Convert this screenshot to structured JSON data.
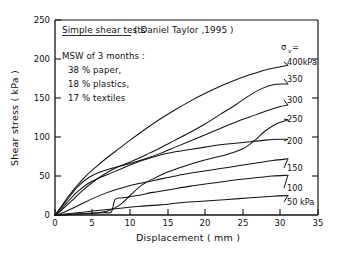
{
  "chart_data": {
    "type": "line",
    "title": "Simple shear tests ( Daniel Taylor ,1995 )",
    "xlabel": "Displacement ( mm )",
    "ylabel": "Shear stress ( kPa )",
    "xlim": [
      0,
      35
    ],
    "ylim": [
      0,
      250
    ],
    "xticks": [
      0,
      5,
      10,
      15,
      20,
      25,
      30,
      35
    ],
    "yticks": [
      0,
      50,
      100,
      150,
      200,
      250
    ],
    "grid": false,
    "legend_position": "right-of-curves (inline end labels)",
    "legend_header": "σv =",
    "annotations": [
      "Simple shear tests ( Daniel Taylor ,1995 )",
      "MSW of 3 months :",
      "38 % paper,",
      "18 % plastics,",
      "17 % textiles"
    ],
    "series": [
      {
        "name": "400 kPa",
        "label": "400kPa",
        "x": [
          0,
          0.4,
          1.0,
          1.8,
          2.8,
          4.0,
          5.5,
          7.0,
          8.5,
          10.0,
          12.0,
          14.0,
          16.0,
          18.0,
          20.0,
          22.0,
          24.0,
          26.0,
          28.0,
          29.5,
          31.0
        ],
        "y": [
          0,
          5,
          13,
          24,
          36,
          49,
          62,
          74,
          85,
          96,
          110,
          123,
          135,
          146,
          156,
          165,
          173,
          180,
          186,
          189,
          192
        ]
      },
      {
        "name": "350 kPa",
        "label": "350",
        "x": [
          0,
          0.5,
          1.2,
          2.2,
          3.5,
          5.0,
          6.5,
          8.0,
          9.5,
          11.0,
          12.5,
          14.0,
          16.0,
          18.0,
          20.0,
          22.0,
          24.0,
          26.0,
          27.5,
          29.0,
          30.5,
          31.0
        ],
        "y": [
          0,
          3,
          9,
          18,
          30,
          42,
          52,
          60,
          66,
          72,
          79,
          86,
          96,
          106,
          117,
          129,
          141,
          154,
          162,
          167,
          168,
          168
        ]
      },
      {
        "name": "300 kPa",
        "label": "300",
        "x": [
          0,
          0.5,
          1.5,
          3.0,
          4.5,
          6.0,
          8.0,
          10.0,
          12.0,
          14.0,
          16.0,
          18.0,
          20.0,
          22.0,
          24.0,
          26.0,
          28.0,
          30.0,
          31.0
        ],
        "y": [
          0,
          6,
          18,
          36,
          48,
          55,
          61,
          66,
          72,
          79,
          87,
          95,
          103,
          111,
          119,
          126,
          133,
          139,
          141
        ]
      },
      {
        "name": "250 kPa",
        "label": "250",
        "x": [
          0,
          1.0,
          2.5,
          4.0,
          5.5,
          7.0,
          8.5,
          10.0,
          11.5,
          13.0,
          15.0,
          17.0,
          19.0,
          21.0,
          23.0,
          25.0,
          26.5,
          28.0,
          29.5,
          31.0
        ],
        "y": [
          0,
          0,
          1,
          2,
          3,
          5,
          12,
          25,
          38,
          46,
          55,
          62,
          68,
          73,
          78,
          85,
          95,
          108,
          117,
          122
        ]
      },
      {
        "name": "200 kPa",
        "label": "200",
        "x": [
          0,
          0.6,
          1.6,
          3.0,
          4.5,
          6.0,
          7.5,
          9.0,
          10.5,
          12.0,
          14.0,
          16.0,
          18.0,
          20.0,
          22.0,
          24.0,
          26.0,
          28.0,
          30.0,
          31.0
        ],
        "y": [
          0,
          5,
          16,
          30,
          41,
          48,
          54,
          60,
          66,
          71,
          77,
          81,
          84,
          87,
          90,
          92,
          94,
          96,
          97,
          97
        ]
      },
      {
        "name": "150 kPa",
        "label": "150",
        "x": [
          0,
          0.8,
          2.0,
          3.5,
          5.0,
          7.0,
          9.0,
          11.0,
          13.0,
          15.0,
          17.0,
          19.0,
          21.0,
          23.0,
          25.0,
          27.0,
          29.0,
          31.0
        ],
        "y": [
          0,
          2,
          7,
          14,
          21,
          29,
          35,
          40,
          44,
          48,
          52,
          55,
          58,
          61,
          64,
          67,
          70,
          72
        ]
      },
      {
        "name": "100 kPa",
        "label": "100",
        "x": [
          0,
          1.0,
          2.5,
          4.5,
          6.5,
          7.5,
          8.0,
          9.0,
          11.0,
          13.0,
          15.0,
          18.0,
          21.0,
          24.0,
          27.0,
          29.0,
          31.0
        ],
        "y": [
          0,
          0,
          1,
          2,
          3,
          4,
          20,
          22,
          25,
          29,
          32,
          37,
          41,
          45,
          48,
          50,
          51
        ]
      },
      {
        "name": "50 kPa",
        "label": "50 kPa",
        "x": [
          0,
          2,
          5,
          8,
          11,
          14,
          17,
          20,
          23,
          26,
          29,
          31
        ],
        "y": [
          0,
          2,
          5,
          8,
          11,
          13,
          16,
          18,
          20,
          22,
          24,
          25
        ]
      }
    ]
  },
  "axes": {
    "y_title": "Shear stress ( kPa )",
    "x_title": "Displacement ( mm )",
    "x_tick_labels": [
      "0",
      "5",
      "10",
      "15",
      "20",
      "25",
      "30",
      "35"
    ],
    "y_tick_labels": [
      "0",
      "50",
      "100",
      "150",
      "200",
      "250"
    ]
  },
  "annotation_block": {
    "title": "Simple shear tests",
    "citation": "( Daniel Taylor ,1995 )",
    "line1": "MSW of 3 months :",
    "line2": "38 % paper,",
    "line3": "18 % plastics,",
    "line4": "17 % textiles"
  },
  "legend": {
    "header_sigma": "σ",
    "header_sub": "v",
    "header_eq": "=",
    "labels": [
      "400kPa",
      "350",
      "300",
      "250",
      "200",
      "150",
      "100",
      "50 kPa"
    ]
  },
  "colors": {
    "ink": "#141414",
    "background": "#ffffff"
  }
}
